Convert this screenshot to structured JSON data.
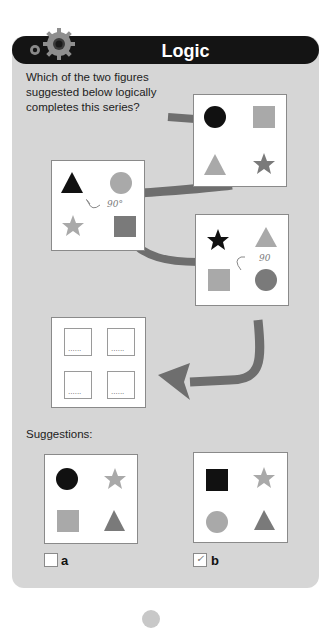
{
  "header": {
    "title": "Logic",
    "icon": "gear-icon"
  },
  "question": {
    "text": "Which of the two figures suggested below logically completes this series?"
  },
  "series": [
    {
      "id": "figure-1",
      "shapes": [
        {
          "pos": "top-left",
          "type": "circle",
          "color": "#111111"
        },
        {
          "pos": "top-right",
          "type": "square",
          "color": "#a9a9a9"
        },
        {
          "pos": "bottom-left",
          "type": "triangle",
          "color": "#a9a9a9"
        },
        {
          "pos": "bottom-right",
          "type": "star",
          "color": "#7a7a7a"
        }
      ]
    },
    {
      "id": "figure-2",
      "annotation": "90°",
      "shapes": [
        {
          "pos": "top-left",
          "type": "triangle",
          "color": "#111111"
        },
        {
          "pos": "top-right",
          "type": "circle",
          "color": "#a9a9a9"
        },
        {
          "pos": "bottom-left",
          "type": "star",
          "color": "#a9a9a9"
        },
        {
          "pos": "bottom-right",
          "type": "square",
          "color": "#7a7a7a"
        }
      ]
    },
    {
      "id": "figure-3",
      "annotation": "90",
      "shapes": [
        {
          "pos": "top-left",
          "type": "star",
          "color": "#111111"
        },
        {
          "pos": "top-right",
          "type": "triangle",
          "color": "#a9a9a9"
        },
        {
          "pos": "bottom-left",
          "type": "square",
          "color": "#a9a9a9"
        },
        {
          "pos": "bottom-right",
          "type": "circle",
          "color": "#7a7a7a"
        }
      ]
    },
    {
      "id": "figure-4-unknown",
      "placeholder_dots": "......"
    }
  ],
  "suggestions": {
    "label": "Suggestions:",
    "options": [
      {
        "label": "a",
        "checked": false,
        "shapes": [
          {
            "pos": "top-left",
            "type": "circle",
            "color": "#111111"
          },
          {
            "pos": "top-right",
            "type": "star",
            "color": "#a9a9a9"
          },
          {
            "pos": "bottom-left",
            "type": "square",
            "color": "#a9a9a9"
          },
          {
            "pos": "bottom-right",
            "type": "triangle",
            "color": "#7a7a7a"
          }
        ]
      },
      {
        "label": "b",
        "checked": true,
        "check_mark": "✓",
        "shapes": [
          {
            "pos": "top-left",
            "type": "square",
            "color": "#111111"
          },
          {
            "pos": "top-right",
            "type": "star",
            "color": "#a9a9a9"
          },
          {
            "pos": "bottom-left",
            "type": "circle",
            "color": "#a9a9a9"
          },
          {
            "pos": "bottom-right",
            "type": "triangle",
            "color": "#7a7a7a"
          }
        ]
      }
    ]
  },
  "colors": {
    "panel": "#d6d6d6",
    "header": "#141414",
    "connector": "#6e6e6e",
    "black_shape": "#111111",
    "light_shape": "#a9a9a9",
    "mid_shape": "#7a7a7a"
  }
}
